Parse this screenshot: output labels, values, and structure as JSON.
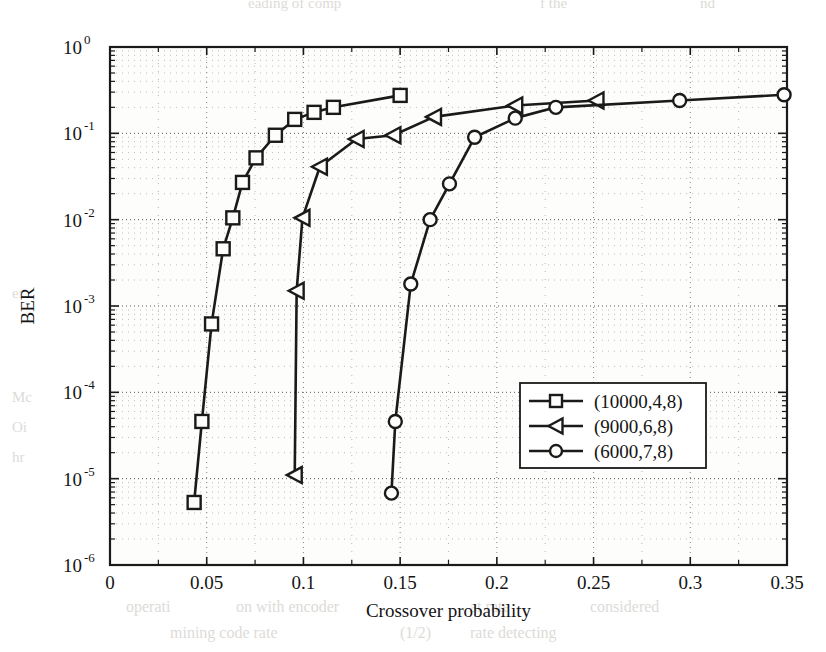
{
  "chart_data": {
    "type": "line",
    "title": "",
    "xlabel": "Crossover probability",
    "ylabel": "BER",
    "xlim": [
      0,
      0.35
    ],
    "ylim": [
      1e-06,
      1
    ],
    "yscale": "log",
    "xscale": "linear",
    "grid": true,
    "grid_style": "dotted-minor-and-major",
    "legend_position": "lower right",
    "xticks": [
      0,
      0.05,
      0.1,
      0.15,
      0.2,
      0.25,
      0.3,
      0.35
    ],
    "xtick_labels": [
      "0",
      "0.05",
      "0.1",
      "0.15",
      "0.2",
      "0.25",
      "0.3",
      "0.35"
    ],
    "yticks": [
      1,
      0.1,
      0.01,
      0.001,
      0.0001,
      1e-05,
      1e-06
    ],
    "ytick_labels": [
      "10^0",
      "10^-1",
      "10^-2",
      "10^-3",
      "10^-4",
      "10^-5",
      "10^-6"
    ],
    "ytick_bases": [
      "10",
      "10",
      "10",
      "10",
      "10",
      "10",
      "10"
    ],
    "ytick_exponents": [
      "0",
      "-1",
      "-2",
      "-3",
      "-4",
      "-5",
      "-6"
    ],
    "series": [
      {
        "name": "(10000,4,8)",
        "marker": "square",
        "color": "#1a1a1a",
        "points": [
          {
            "x": 0.0435,
            "y": 5.3e-06
          },
          {
            "x": 0.0475,
            "y": 4.6e-05
          },
          {
            "x": 0.0525,
            "y": 0.00062
          },
          {
            "x": 0.0585,
            "y": 0.0046
          },
          {
            "x": 0.0635,
            "y": 0.0105
          },
          {
            "x": 0.0685,
            "y": 0.027
          },
          {
            "x": 0.0755,
            "y": 0.052
          },
          {
            "x": 0.0855,
            "y": 0.095
          },
          {
            "x": 0.0955,
            "y": 0.145
          },
          {
            "x": 0.1055,
            "y": 0.175
          },
          {
            "x": 0.1155,
            "y": 0.2
          },
          {
            "x": 0.15,
            "y": 0.275
          }
        ]
      },
      {
        "name": "(9000,6,8)",
        "marker": "triangle-left",
        "color": "#1a1a1a",
        "points": [
          {
            "x": 0.0955,
            "y": 1.1e-05
          },
          {
            "x": 0.0965,
            "y": 0.0015
          },
          {
            "x": 0.0995,
            "y": 0.0105
          },
          {
            "x": 0.1085,
            "y": 0.041
          },
          {
            "x": 0.1275,
            "y": 0.086
          },
          {
            "x": 0.1465,
            "y": 0.095
          },
          {
            "x": 0.1675,
            "y": 0.155
          },
          {
            "x": 0.2095,
            "y": 0.21
          },
          {
            "x": 0.2515,
            "y": 0.24
          }
        ]
      },
      {
        "name": "(6000,7,8)",
        "marker": "circle",
        "color": "#1a1a1a",
        "points": [
          {
            "x": 0.1455,
            "y": 6.8e-06
          },
          {
            "x": 0.1475,
            "y": 4.6e-05
          },
          {
            "x": 0.1555,
            "y": 0.0018
          },
          {
            "x": 0.1655,
            "y": 0.01
          },
          {
            "x": 0.1755,
            "y": 0.026
          },
          {
            "x": 0.1885,
            "y": 0.09
          },
          {
            "x": 0.2095,
            "y": 0.15
          },
          {
            "x": 0.2305,
            "y": 0.2
          },
          {
            "x": 0.2945,
            "y": 0.24
          },
          {
            "x": 0.3485,
            "y": 0.28
          }
        ]
      }
    ],
    "legend_entries": [
      "(10000,4,8)",
      "(9000,6,8)",
      "(6000,7,8)"
    ]
  },
  "background_page_text": [
    {
      "text": "eading of comp",
      "x": 248,
      "y": 8,
      "size": 15
    },
    {
      "text": "f the",
      "x": 540,
      "y": 8,
      "size": 15
    },
    {
      "text": "nd",
      "x": 700,
      "y": 8,
      "size": 15
    },
    {
      "text": "er",
      "x": 12,
      "y": 298,
      "size": 15
    },
    {
      "text": "Mc",
      "x": 12,
      "y": 402,
      "size": 15
    },
    {
      "text": "Oi",
      "x": 12,
      "y": 432,
      "size": 15
    },
    {
      "text": "hr",
      "x": 12,
      "y": 462,
      "size": 15
    },
    {
      "text": "operati",
      "x": 126,
      "y": 612,
      "size": 16
    },
    {
      "text": "on with encoder",
      "x": 236,
      "y": 612,
      "size": 16
    },
    {
      "text": "at rate",
      "x": 470,
      "y": 612,
      "size": 16
    },
    {
      "text": "considered",
      "x": 590,
      "y": 612,
      "size": 16
    },
    {
      "text": "mining code rate",
      "x": 170,
      "y": 638,
      "size": 16
    },
    {
      "text": "(1/2)",
      "x": 400,
      "y": 638,
      "size": 16
    },
    {
      "text": "rate detecting",
      "x": 470,
      "y": 638,
      "size": 16
    }
  ]
}
